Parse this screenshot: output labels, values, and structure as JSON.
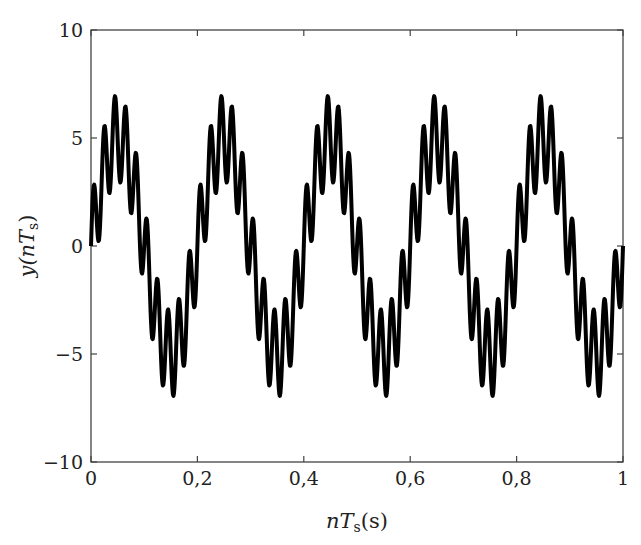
{
  "chart_data": {
    "type": "line",
    "title": "",
    "xlabel": "nT_s(s)",
    "ylabel": "y(nT_s)",
    "xlim": [
      0,
      1
    ],
    "ylim": [
      -10,
      10
    ],
    "grid": false,
    "legend": null,
    "x_ticks": [
      0,
      0.2,
      0.4,
      0.6,
      0.8,
      1
    ],
    "x_tick_labels": [
      "0",
      "0,2",
      "0,4",
      "0,6",
      "0,8",
      "1"
    ],
    "y_ticks": [
      -10,
      -5,
      0,
      5,
      10
    ],
    "y_tick_labels": [
      "−10",
      "−5",
      "0",
      "5",
      "10"
    ],
    "series": [
      {
        "name": "y(nTs)",
        "color": "#000000",
        "line_width": 4,
        "formula": "5*sin(2*pi*5*t) + 2*sin(2*pi*50*t)",
        "formula_note": "approximate stand-in chosen to match the visual shape; amplitudes and ripple frequency not measured",
        "samples": 1000
      }
    ]
  },
  "labels": {
    "xlabel_main": "nT",
    "xlabel_sub": "s",
    "xlabel_tail": "(s)",
    "ylabel_main": "y(nT",
    "ylabel_sub": "s",
    "ylabel_tail": ")"
  }
}
